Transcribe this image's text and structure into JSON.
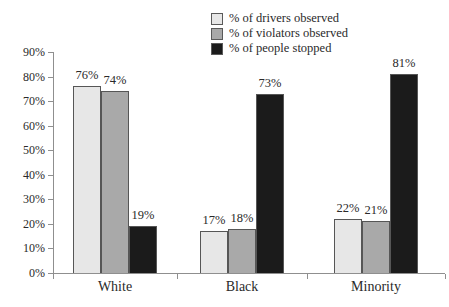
{
  "chart_data": {
    "type": "bar",
    "categories": [
      "White",
      "Black",
      "Minority"
    ],
    "series": [
      {
        "name": "% of drivers observed",
        "color": "#e7e7e7",
        "values": [
          76,
          17,
          22
        ]
      },
      {
        "name": "% of violators observed",
        "color": "#a9a9a9",
        "values": [
          74,
          18,
          21
        ]
      },
      {
        "name": "% of people stopped",
        "color": "#1b1b1b",
        "values": [
          19,
          73,
          81
        ]
      }
    ],
    "value_label_suffix": "%",
    "yticks": [
      "0%",
      "10%",
      "20%",
      "30%",
      "40%",
      "50%",
      "60%",
      "70%",
      "80%",
      "90%"
    ],
    "ylim": [
      0,
      90
    ],
    "grid": false,
    "legend_position": "top-center"
  },
  "colors": {
    "background": "#ffffff",
    "axis": "#8f8f8f",
    "text": "#2a2a2a",
    "bar_border": "#565656"
  }
}
